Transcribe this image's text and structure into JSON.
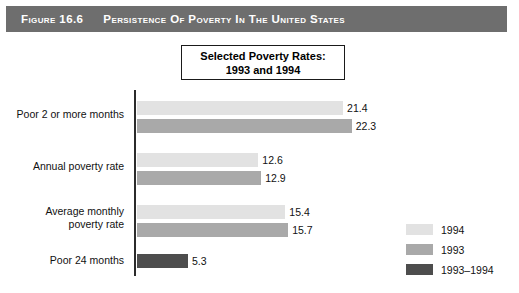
{
  "banner": {
    "figure_number": "Figure 16.6",
    "figure_title": "Persistence of Poverty in the United States",
    "background_color": "#6e6e6e",
    "text_color": "#ffffff"
  },
  "chart_title_box": {
    "line1": "Selected Poverty Rates:",
    "line2": "1993 and 1994"
  },
  "chart_data": {
    "type": "bar",
    "orientation": "horizontal",
    "title": "Selected Poverty Rates: 1993 and 1994",
    "xlabel": "",
    "ylabel": "",
    "xlim": [
      0,
      24
    ],
    "grid": false,
    "legend_position": "right-bottom",
    "categories": [
      "Poor 2 or more months",
      "Annual poverty rate",
      "Average monthly poverty rate",
      "Poor 24 months"
    ],
    "series": [
      {
        "name": "1994",
        "color": "#e2e2e2",
        "values": [
          21.4,
          12.6,
          15.4,
          null
        ]
      },
      {
        "name": "1993",
        "color": "#a9a9a9",
        "values": [
          22.3,
          12.9,
          15.7,
          null
        ]
      },
      {
        "name": "1993–1994",
        "color": "#4d4d4d",
        "values": [
          null,
          null,
          null,
          5.3
        ]
      }
    ],
    "groups": [
      {
        "label_line1": "Poor 2 or more months",
        "label_line2": "",
        "bars": [
          {
            "series": "1994",
            "value": 21.4,
            "value_label": "21.4",
            "color": "#e2e2e2"
          },
          {
            "series": "1993",
            "value": 22.3,
            "value_label": "22.3",
            "color": "#a9a9a9"
          }
        ]
      },
      {
        "label_line1": "Annual poverty rate",
        "label_line2": "",
        "bars": [
          {
            "series": "1994",
            "value": 12.6,
            "value_label": "12.6",
            "color": "#e2e2e2"
          },
          {
            "series": "1993",
            "value": 12.9,
            "value_label": "12.9",
            "color": "#a9a9a9"
          }
        ]
      },
      {
        "label_line1": "Average monthly",
        "label_line2": "poverty rate",
        "bars": [
          {
            "series": "1994",
            "value": 15.4,
            "value_label": "15.4",
            "color": "#e2e2e2"
          },
          {
            "series": "1993",
            "value": 15.7,
            "value_label": "15.7",
            "color": "#a9a9a9"
          }
        ]
      },
      {
        "label_line1": "Poor 24 months",
        "label_line2": "",
        "bars": [
          {
            "series": "1993–1994",
            "value": 5.3,
            "value_label": "5.3",
            "color": "#4d4d4d"
          }
        ]
      }
    ],
    "legend": [
      {
        "label": "1994",
        "color": "#e2e2e2"
      },
      {
        "label": "1993",
        "color": "#a9a9a9"
      },
      {
        "label": "1993–1994",
        "color": "#4d4d4d"
      }
    ]
  }
}
